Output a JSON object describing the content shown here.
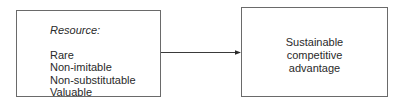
{
  "left_box": {
    "title": "Resource:",
    "items": [
      "Rare",
      "Non-imitable",
      "Non-substitutable",
      "Valuable"
    ]
  },
  "right_box": {
    "lines": [
      "Sustainable",
      "competitive",
      "advantage"
    ]
  },
  "colors": {
    "stroke": "#6a6a6a",
    "text": "#2a2a2a"
  }
}
